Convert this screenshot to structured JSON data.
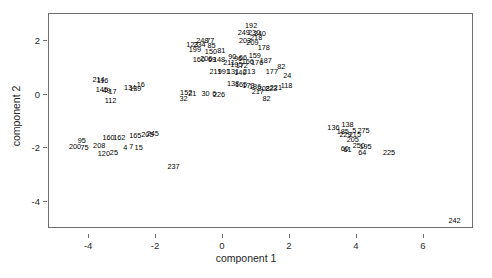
{
  "chart_data": {
    "type": "scatter",
    "title": "",
    "subtitle": "",
    "xlabel": "component 1",
    "ylabel": "component 2",
    "xlim": [
      -5.2,
      7.5
    ],
    "ylim": [
      -5.0,
      3.0
    ],
    "xticks": [
      -4,
      -2,
      0,
      2,
      4,
      6
    ],
    "yticks": [
      2,
      0,
      -2,
      -4
    ],
    "xtick_labels": [
      "-4",
      "-2",
      "0",
      "2",
      "4",
      "6"
    ],
    "ytick_labels": [
      "2",
      "0",
      "-2",
      "-4"
    ],
    "grid": false,
    "legend": null,
    "legend_position": "none",
    "marker_style": "text-label",
    "note": "Each observation is drawn as its numeric case label instead of a plotting symbol.",
    "points": [
      {
        "label": "192",
        "x": 0.84,
        "y": 2.55
      },
      {
        "label": "249",
        "x": 0.62,
        "y": 2.28
      },
      {
        "label": "230",
        "x": 0.93,
        "y": 2.3
      },
      {
        "label": "240",
        "x": 1.1,
        "y": 2.26
      },
      {
        "label": "218",
        "x": 0.99,
        "y": 2.12
      },
      {
        "label": "203",
        "x": 0.66,
        "y": 2.0
      },
      {
        "label": "209",
        "x": 0.88,
        "y": 1.92
      },
      {
        "label": "248",
        "x": -0.62,
        "y": 1.99
      },
      {
        "label": "77",
        "x": -0.38,
        "y": 2.01
      },
      {
        "label": "123",
        "x": -0.92,
        "y": 1.84
      },
      {
        "label": "234",
        "x": -0.7,
        "y": 1.83
      },
      {
        "label": "85",
        "x": -0.34,
        "y": 1.8
      },
      {
        "label": "199",
        "x": -0.84,
        "y": 1.66
      },
      {
        "label": "150",
        "x": -0.36,
        "y": 1.6
      },
      {
        "label": "81",
        "x": -0.05,
        "y": 1.62
      },
      {
        "label": "178",
        "x": 1.22,
        "y": 1.74
      },
      {
        "label": "160",
        "x": -0.72,
        "y": 1.3
      },
      {
        "label": "206",
        "x": -0.5,
        "y": 1.31
      },
      {
        "label": "69",
        "x": -0.33,
        "y": 1.29
      },
      {
        "label": "148",
        "x": -0.12,
        "y": 1.28
      },
      {
        "label": "159",
        "x": 0.95,
        "y": 1.42
      },
      {
        "label": "90",
        "x": 0.28,
        "y": 1.4
      },
      {
        "label": "96",
        "x": 0.45,
        "y": 1.33
      },
      {
        "label": "66",
        "x": 0.6,
        "y": 1.36
      },
      {
        "label": "166",
        "x": 0.74,
        "y": 1.22
      },
      {
        "label": "176",
        "x": 1.02,
        "y": 1.18
      },
      {
        "label": "187",
        "x": 1.28,
        "y": 1.25
      },
      {
        "label": "211",
        "x": 0.18,
        "y": 1.16
      },
      {
        "label": "195",
        "x": 0.4,
        "y": 1.12
      },
      {
        "label": "172",
        "x": 0.56,
        "y": 1.06
      },
      {
        "label": "219",
        "x": -0.22,
        "y": 0.86
      },
      {
        "label": "191",
        "x": 0.02,
        "y": 0.83
      },
      {
        "label": "131",
        "x": 0.3,
        "y": 0.86
      },
      {
        "label": "140",
        "x": 0.52,
        "y": 0.8
      },
      {
        "label": "213",
        "x": 0.78,
        "y": 0.84
      },
      {
        "label": "82",
        "x": 1.74,
        "y": 1.04
      },
      {
        "label": "24",
        "x": 1.92,
        "y": 0.7
      },
      {
        "label": "177",
        "x": 1.46,
        "y": 0.86
      },
      {
        "label": "214",
        "x": -3.72,
        "y": 0.55
      },
      {
        "label": "116",
        "x": -3.6,
        "y": 0.5
      },
      {
        "label": "145",
        "x": -3.62,
        "y": 0.18
      },
      {
        "label": "49",
        "x": -3.48,
        "y": 0.14
      },
      {
        "label": "17",
        "x": -3.3,
        "y": 0.1
      },
      {
        "label": "134",
        "x": -2.78,
        "y": 0.26
      },
      {
        "label": "139",
        "x": -2.62,
        "y": 0.22
      },
      {
        "label": "16",
        "x": -2.46,
        "y": 0.36
      },
      {
        "label": "112",
        "x": -3.36,
        "y": -0.22
      },
      {
        "label": "138",
        "x": 0.3,
        "y": 0.4
      },
      {
        "label": "165",
        "x": 0.54,
        "y": 0.36
      },
      {
        "label": "173",
        "x": 0.76,
        "y": 0.32
      },
      {
        "label": "186",
        "x": 0.96,
        "y": 0.28
      },
      {
        "label": "118",
        "x": 1.9,
        "y": 0.32
      },
      {
        "label": "221",
        "x": 1.58,
        "y": 0.26
      },
      {
        "label": "223",
        "x": 1.44,
        "y": 0.22
      },
      {
        "label": "208",
        "x": 1.22,
        "y": 0.2
      },
      {
        "label": "217",
        "x": 1.04,
        "y": 0.1
      },
      {
        "label": "152",
        "x": -1.1,
        "y": 0.06
      },
      {
        "label": "21",
        "x": -0.92,
        "y": 0.02
      },
      {
        "label": "30",
        "x": -0.52,
        "y": 0.04
      },
      {
        "label": "6",
        "x": -0.26,
        "y": 0.02
      },
      {
        "label": "226",
        "x": -0.12,
        "y": 0.0
      },
      {
        "label": "32",
        "x": -1.18,
        "y": -0.18
      },
      {
        "label": "82b",
        "x": 1.3,
        "y": -0.16
      },
      {
        "label": "136",
        "x": 3.3,
        "y": -1.24
      },
      {
        "label": "138b",
        "x": 3.72,
        "y": -1.12
      },
      {
        "label": "185",
        "x": 3.58,
        "y": -1.38
      },
      {
        "label": "5",
        "x": 3.92,
        "y": -1.36
      },
      {
        "label": "275",
        "x": 4.2,
        "y": -1.34
      },
      {
        "label": "229",
        "x": 3.66,
        "y": -1.5
      },
      {
        "label": "215",
        "x": 3.94,
        "y": -1.52
      },
      {
        "label": "205",
        "x": 3.88,
        "y": -1.7
      },
      {
        "label": "250",
        "x": 4.06,
        "y": -1.92
      },
      {
        "label": "195b",
        "x": 4.26,
        "y": -1.96
      },
      {
        "label": "60",
        "x": 3.64,
        "y": -2.02
      },
      {
        "label": "61",
        "x": 3.72,
        "y": -2.06
      },
      {
        "label": "64",
        "x": 4.16,
        "y": -2.18
      },
      {
        "label": "225",
        "x": 4.96,
        "y": -2.16
      },
      {
        "label": "95",
        "x": -4.22,
        "y": -1.72
      },
      {
        "label": "200",
        "x": -4.42,
        "y": -1.96
      },
      {
        "label": "75",
        "x": -4.14,
        "y": -1.98
      },
      {
        "label": "208b",
        "x": -3.7,
        "y": -1.92
      },
      {
        "label": "160b",
        "x": -3.42,
        "y": -1.62
      },
      {
        "label": "162",
        "x": -3.1,
        "y": -1.6
      },
      {
        "label": "165b",
        "x": -2.62,
        "y": -1.54
      },
      {
        "label": "205b",
        "x": -2.26,
        "y": -1.5
      },
      {
        "label": "245",
        "x": -2.1,
        "y": -1.46
      },
      {
        "label": "25",
        "x": -3.26,
        "y": -2.16
      },
      {
        "label": "120",
        "x": -3.56,
        "y": -2.2
      },
      {
        "label": "4",
        "x": -2.92,
        "y": -1.98
      },
      {
        "label": "7",
        "x": -2.74,
        "y": -1.96
      },
      {
        "label": "15",
        "x": -2.52,
        "y": -1.98
      },
      {
        "label": "237",
        "x": -1.48,
        "y": -2.7
      },
      {
        "label": "242",
        "x": 6.92,
        "y": -4.72
      }
    ]
  },
  "axes": {
    "x_title": "component 1",
    "y_title": "component 2"
  }
}
